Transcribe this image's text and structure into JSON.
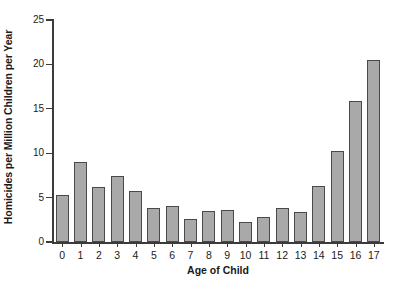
{
  "chart_data": {
    "type": "bar",
    "title": "",
    "xlabel": "Age of Child",
    "ylabel": "Homicides per Million Children per Year",
    "categories": [
      "0",
      "1",
      "2",
      "3",
      "4",
      "5",
      "6",
      "7",
      "8",
      "9",
      "10",
      "11",
      "12",
      "13",
      "14",
      "15",
      "16",
      "17"
    ],
    "values": [
      5.3,
      9.0,
      6.2,
      7.4,
      5.7,
      3.8,
      4.0,
      2.6,
      3.5,
      3.6,
      2.3,
      2.8,
      3.8,
      3.4,
      6.3,
      10.2,
      15.9,
      20.5
    ],
    "ylim": [
      0,
      25
    ],
    "yticks": [
      0,
      5,
      10,
      15,
      20,
      25
    ],
    "ytick_labels": [
      "0",
      "5",
      "10",
      "15",
      "20",
      "25"
    ],
    "grid": false,
    "legend": null,
    "bar_color": "#a9a9a9",
    "bar_edge_color": "#4a4a4a",
    "axis_color": "#3b3b3b",
    "background_color": "#ffffff"
  }
}
